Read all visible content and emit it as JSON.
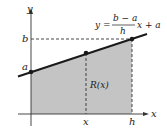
{
  "diagram": {
    "axes": {
      "x_label": "x",
      "y_label": "y"
    },
    "tick_labels": {
      "y_b": "b",
      "y_a": "a",
      "x_x": "x",
      "x_h": "h"
    },
    "region_label": "R(x)",
    "equation": {
      "lhs": "y =",
      "numerator": "b − a",
      "denominator": "h",
      "rhs": "x + a"
    },
    "colors": {
      "fill": "#c4c4c4",
      "line": "#1a1a1a"
    }
  }
}
